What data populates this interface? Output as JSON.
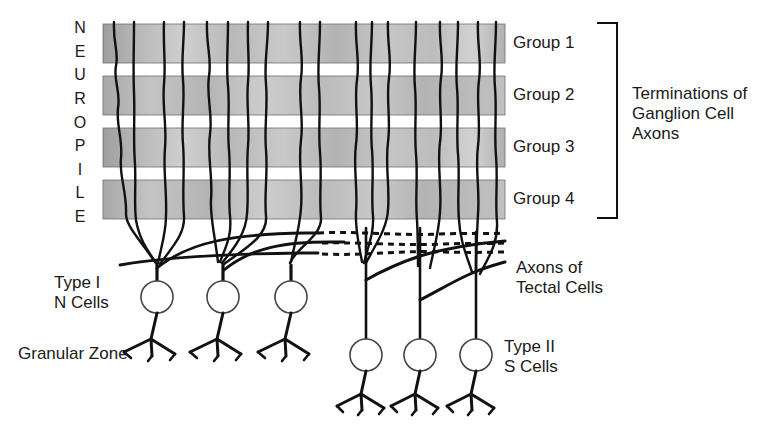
{
  "figure": {
    "title_vertical": "NEUROPILE",
    "vertical_letters": [
      "N",
      "E",
      "U",
      "R",
      "O",
      "P",
      "I",
      "L",
      "E"
    ],
    "background_color": "#ffffff",
    "ink_color": "#1a1a1a",
    "band_fill_color": "#bdbdbd"
  },
  "neuropile": {
    "label": "NEUROPILE",
    "bands": [
      {
        "name": "Group 1",
        "label": "Group 1"
      },
      {
        "name": "Group 2",
        "label": "Group 2"
      },
      {
        "name": "Group 3",
        "label": "Group 3"
      },
      {
        "name": "Group 4",
        "label": "Group 4"
      }
    ]
  },
  "bracket": {
    "caption_line1": "Terminations of",
    "caption_line2": "Ganglion Cell",
    "caption_line3": "Axons"
  },
  "cells": {
    "type_one": {
      "label_line1": "Type I",
      "label_line2": "N Cells"
    },
    "type_two": {
      "label_line1": "Type II",
      "label_line2": "S Cells"
    },
    "granular_zone": {
      "label": "Granular Zone"
    },
    "tectal_axons": {
      "label_line1": "Axons of",
      "label_line2": "Tectal Cells"
    }
  }
}
